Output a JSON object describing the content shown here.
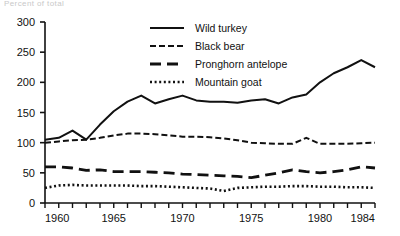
{
  "figure": {
    "cropped_top_text": "Percent of total",
    "background": "#ffffff",
    "ink_color": "#111111"
  },
  "chart_data": {
    "type": "line",
    "title": "",
    "subtitle": "",
    "xlabel": "",
    "ylabel": "",
    "xlim": [
      1960,
      1984
    ],
    "ylim": [
      0,
      300
    ],
    "grid": false,
    "legend_position": "top-center",
    "y_ticks": [
      0,
      50,
      100,
      150,
      200,
      250,
      300
    ],
    "y_tick_labels": [
      "0",
      "50",
      "100",
      "150",
      "200",
      "250",
      "300"
    ],
    "x_ticks": [
      1960,
      1961,
      1962,
      1963,
      1964,
      1965,
      1966,
      1967,
      1968,
      1969,
      1970,
      1971,
      1972,
      1973,
      1974,
      1975,
      1976,
      1977,
      1978,
      1979,
      1980,
      1981,
      1982,
      1983,
      1984
    ],
    "x_tick_labels_shown": [
      "1960",
      "1965",
      "1970",
      "1975",
      "1980",
      "1984"
    ],
    "x": [
      1960,
      1961,
      1962,
      1963,
      1964,
      1965,
      1966,
      1967,
      1968,
      1969,
      1970,
      1971,
      1972,
      1973,
      1974,
      1975,
      1976,
      1977,
      1978,
      1979,
      1980,
      1981,
      1982,
      1983,
      1984
    ],
    "series": [
      {
        "name": "Wild turkey",
        "style": "solid",
        "values": [
          105,
          108,
          120,
          105,
          130,
          152,
          168,
          178,
          165,
          172,
          178,
          170,
          168,
          168,
          166,
          170,
          172,
          165,
          175,
          180,
          200,
          215,
          225,
          237,
          225
        ]
      },
      {
        "name": "Black bear",
        "style": "dashed",
        "values": [
          100,
          102,
          104,
          105,
          108,
          112,
          115,
          115,
          114,
          112,
          110,
          110,
          109,
          107,
          104,
          100,
          99,
          98,
          98,
          108,
          98,
          98,
          98,
          99,
          100
        ]
      },
      {
        "name": "Pronghorn antelope",
        "style": "long-dash",
        "values": [
          60,
          60,
          58,
          54,
          55,
          52,
          52,
          52,
          51,
          50,
          48,
          47,
          46,
          45,
          44,
          42,
          46,
          50,
          55,
          52,
          50,
          52,
          55,
          60,
          58
        ]
      },
      {
        "name": "Mountain goat",
        "style": "dotted",
        "values": [
          25,
          29,
          30,
          29,
          29,
          29,
          29,
          28,
          28,
          27,
          26,
          25,
          24,
          20,
          25,
          26,
          27,
          27,
          28,
          28,
          27,
          27,
          26,
          26,
          25
        ]
      }
    ]
  },
  "legend": {
    "items": [
      {
        "label": "Wild turkey",
        "style": "solid"
      },
      {
        "label": "Black bear",
        "style": "dashed"
      },
      {
        "label": "Pronghorn antelope",
        "style": "long-dash"
      },
      {
        "label": "Mountain goat",
        "style": "dotted"
      }
    ]
  }
}
